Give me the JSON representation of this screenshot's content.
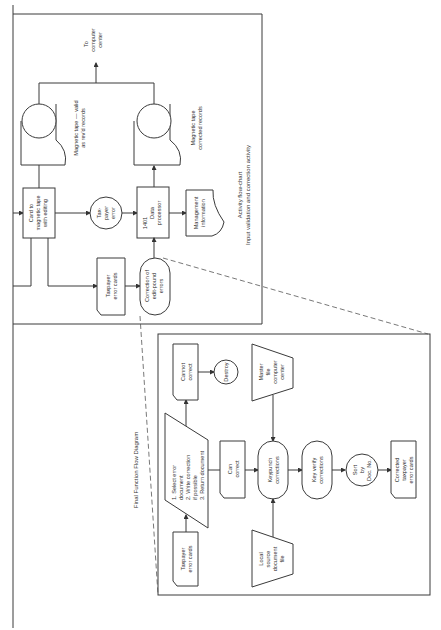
{
  "top_panel": {
    "caption_line1": "Activity flow-chart",
    "caption_line2": "Input validation and correction activity",
    "nodes": {
      "card_to_tape": [
        "Card to",
        "magnetic tape",
        "with editing"
      ],
      "tape_valid": [
        "Magnetic tape — valid",
        "as rev'd records"
      ],
      "to_computer": [
        "To",
        "computer",
        "center"
      ],
      "taxpayer_error": [
        "Tax-",
        "payer",
        "error"
      ],
      "data_processor": [
        "1401",
        "Data",
        "processor"
      ],
      "tape_corrected": [
        "Magnetic tape",
        "corrected records"
      ],
      "management_info": [
        "Management",
        "information"
      ],
      "taxpayer_error_cards": [
        "Taxpayer",
        "error cards"
      ],
      "correction": [
        "Correction of",
        "edit-pound",
        "errors"
      ]
    }
  },
  "bottom_panel": {
    "caption": "Final Function Flow Diagram",
    "nodes": {
      "taxpayer_error_cards": [
        "Taxpayer",
        "error cards"
      ],
      "select_error": [
        "1.  Select error",
        "     document",
        "2.  Write correction",
        "     if possible",
        "3.  Return document"
      ],
      "cannot_correct": [
        "Cannot",
        "correct"
      ],
      "destroy": [
        "Destroy"
      ],
      "can_correct": [
        "Can",
        "correct"
      ],
      "master_file": [
        "Master",
        "file",
        "computer",
        "center"
      ],
      "local_source": [
        "Local",
        "source",
        "document",
        "file"
      ],
      "keypunch": [
        "Keypunch",
        "corrections"
      ],
      "key_verify": [
        "Key verify",
        "corrections"
      ],
      "sort": [
        "Sort",
        "by",
        "Doc. No."
      ],
      "corrected_cards": [
        "Corrected",
        "taxpayer",
        "error cards"
      ]
    }
  }
}
